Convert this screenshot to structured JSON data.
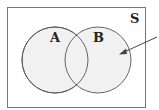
{
  "diagram": {
    "type": "venn",
    "universe_label": "S",
    "sets": [
      {
        "label": "A"
      },
      {
        "label": "B"
      }
    ],
    "arrow_target": "B only region",
    "colors": {
      "fill": "#f1f1f1",
      "stroke": "#555555",
      "border": "#777777",
      "background": "#ffffff"
    }
  }
}
